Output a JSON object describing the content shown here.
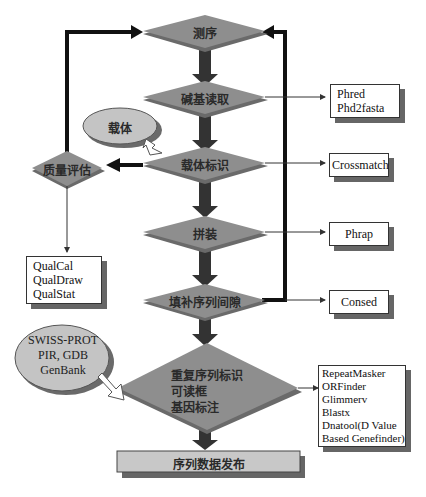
{
  "diagram": {
    "main_steps": [
      {
        "id": "sequencing",
        "label": "测序"
      },
      {
        "id": "base_calling",
        "label": "碱基读取"
      },
      {
        "id": "vector_identification",
        "label": "载体标识"
      },
      {
        "id": "assembly",
        "label": "拼装"
      },
      {
        "id": "gap_filling",
        "label": "填补序列间隙"
      },
      {
        "id": "annotation",
        "lines": [
          "重复序列标识",
          "可读框",
          "基因标注"
        ]
      }
    ],
    "final_step": {
      "label": "序列数据发布"
    },
    "quality": {
      "label": "质量评估"
    },
    "inputs": {
      "vector": {
        "label": "载体"
      },
      "databases": {
        "lines": [
          "SWISS-PROT",
          "PIR, GDB",
          "GenBank"
        ]
      }
    },
    "tools": {
      "base_calling": {
        "lines": [
          "Phred",
          "Phd2fasta"
        ]
      },
      "vector_identification": {
        "lines": [
          "Crossmatch"
        ]
      },
      "assembly": {
        "lines": [
          "Phrap"
        ]
      },
      "gap_filling": {
        "lines": [
          "Consed"
        ]
      },
      "quality": {
        "lines": [
          "QualCal",
          "QualDraw",
          "QualStat"
        ]
      },
      "annotation": {
        "lines": [
          "RepeatMasker",
          "ORFinder",
          "Glimmerv",
          "Blastx",
          "Dnatool(D Value",
          "Based Genefinder)"
        ]
      }
    },
    "colors": {
      "diamond_fill": "#8e8e8e",
      "diamond_shadow": "#6a6a6a",
      "ellipse_fill": "#c4c4c4",
      "final_box_fill": "#c8c8c8",
      "arrow": "#333333"
    }
  }
}
